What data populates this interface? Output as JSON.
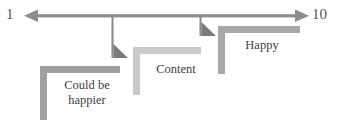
{
  "diagram": {
    "axis": {
      "min_label": "1",
      "max_label": "10",
      "orientation": "horizontal",
      "double_headed": true,
      "color": "#8c8c8c",
      "y": 16,
      "x_start": 28,
      "x_end": 305
    },
    "pointers": [
      {
        "name": "pointer-could-be-happier",
        "x": 113,
        "y_end": 58,
        "color": "#808080"
      },
      {
        "name": "pointer-content",
        "x": 201,
        "y_end": 36,
        "color": "#808080"
      }
    ],
    "brackets": [
      {
        "id": "could-be-happier",
        "label": "Could be\nhappier",
        "color": "#a0a0a0",
        "x": 40,
        "y": 66,
        "width": 80,
        "height": 54,
        "bar": 7
      },
      {
        "id": "content",
        "label": "Content",
        "color": "#c9c9c9",
        "x": 133,
        "y": 47,
        "width": 68,
        "height": 48,
        "bar": 7
      },
      {
        "id": "happy",
        "label": "Happy",
        "color": "#a8a8a8",
        "x": 218,
        "y": 26,
        "width": 82,
        "height": 48,
        "bar": 7
      }
    ]
  }
}
